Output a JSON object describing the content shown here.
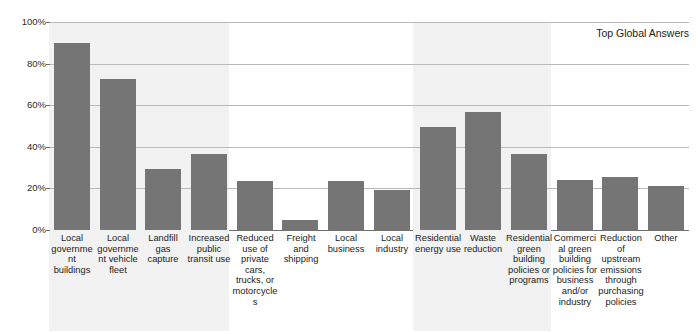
{
  "chart_data": {
    "type": "bar",
    "title": "Top Global Answers",
    "xlabel": "",
    "ylabel": "",
    "ylim": [
      0,
      100
    ],
    "ytick_labels": [
      "0%",
      "20%",
      "40%",
      "60%",
      "80%",
      "100%"
    ],
    "ytick_values": [
      0,
      20,
      40,
      60,
      80,
      100
    ],
    "grid": true,
    "legend": "none",
    "bar_color": "#757575",
    "band_color": "#f2f2f2",
    "gridline_color": "#b9b9b9",
    "categories": [
      "Local government buildings",
      "Local government vehicle fleet",
      "Landfill gas capture",
      "Increased public transit use",
      "Reduced use of private cars, trucks, or motorcycles",
      "Freight and shipping",
      "Local business",
      "Local industry",
      "Residential energy use",
      "Waste reduction",
      "Residential green building policies or programs",
      "Commercial green building policies for business and/or industry",
      "Reduction of upstream emissions through purchasing policies",
      "Other"
    ],
    "values": [
      90,
      72.5,
      29.5,
      36.5,
      23.5,
      5,
      23.5,
      19,
      49.5,
      56.5,
      36.5,
      24,
      25.5,
      21
    ],
    "shaded_bands": [
      {
        "start_index": 0,
        "end_index": 3
      },
      {
        "start_index": 8,
        "end_index": 10
      }
    ]
  }
}
